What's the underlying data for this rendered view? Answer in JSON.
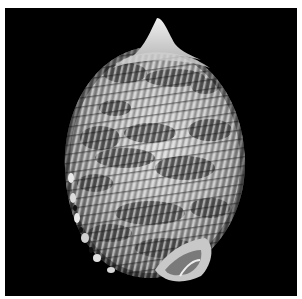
{
  "image": {
    "subject": "bonnet-shell",
    "description": "Grayscale photograph of a spirally ribbed bonnet sea shell with dark mottled bands, on a black background with a thin white border",
    "colors": {
      "border": "#ffffff",
      "background": "#000000",
      "shell_light": "#e6e6e6",
      "shell_mid": "#9a9a9a",
      "shell_dark": "#3c3c3c"
    }
  }
}
